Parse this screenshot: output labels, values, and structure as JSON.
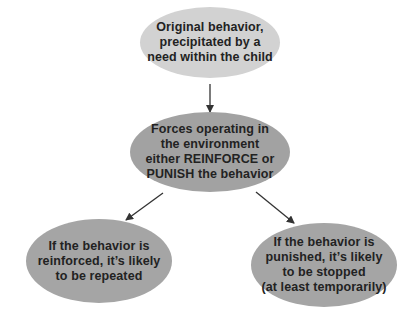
{
  "diagram": {
    "type": "flowchart",
    "nodes": {
      "top": {
        "text": "Original behavior,\nprecipitated by a\nneed within the child",
        "fill": "#d2d2d2"
      },
      "middle": {
        "text": "Forces operating in\nthe environment\neither REINFORCE or\nPUNISH the behavior",
        "fill": "#a2a2a2"
      },
      "left": {
        "text": "If the behavior is\nreinforced, it’s likely\nto be repeated",
        "fill": "#a5a5a5"
      },
      "right": {
        "text": "If the behavior is\npunished, it’s likely\nto be stopped\n(at least temporarily)",
        "fill": "#a5a5a5"
      }
    },
    "edges": [
      {
        "from": "top",
        "to": "middle"
      },
      {
        "from": "middle",
        "to": "left"
      },
      {
        "from": "middle",
        "to": "right"
      }
    ],
    "colors": {
      "text": "#222222",
      "arrow": "#333333",
      "background": "#ffffff"
    }
  }
}
